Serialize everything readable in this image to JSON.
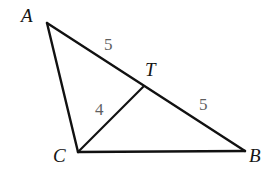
{
  "figure": {
    "kind": "geometry-diagram",
    "background_color": "#ffffff",
    "stroke_color": "#111111",
    "stroke_width": 2.2,
    "label_color": "#151515",
    "measure_color": "#5f5f5f",
    "width": 277,
    "height": 175,
    "points": {
      "A": {
        "label": "A",
        "x": 47,
        "y": 23
      },
      "T": {
        "label": "T",
        "x": 143,
        "y": 87
      },
      "C": {
        "label": "C",
        "x": 78,
        "y": 152
      },
      "B": {
        "label": "B",
        "x": 245,
        "y": 151
      }
    },
    "segments": [
      {
        "name": "AB",
        "from": "A",
        "to": "B"
      },
      {
        "name": "AC",
        "from": "A",
        "to": "C"
      },
      {
        "name": "CB",
        "from": "C",
        "to": "B"
      },
      {
        "name": "CT",
        "from": "C",
        "to": "T"
      }
    ],
    "measures": [
      {
        "name": "AT",
        "segment": "AT",
        "value": "5"
      },
      {
        "name": "TB",
        "segment": "TB",
        "value": "5"
      },
      {
        "name": "CT",
        "segment": "CT",
        "value": "4"
      }
    ]
  }
}
